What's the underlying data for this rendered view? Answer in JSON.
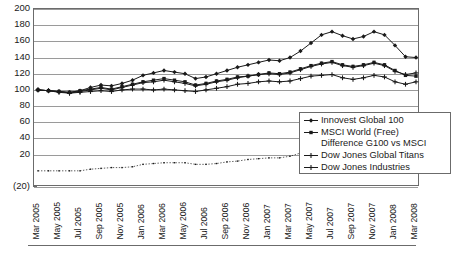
{
  "chart_data": {
    "type": "line",
    "title": "",
    "subtitle": "",
    "xlabel": "",
    "ylabel": "",
    "ylim": [
      -20,
      200
    ],
    "ytick_values": [
      200,
      180,
      160,
      140,
      120,
      100,
      80,
      60,
      40,
      20,
      0,
      -20
    ],
    "ytick_labels": [
      "200",
      "180",
      "160",
      "140",
      "120",
      "100",
      "80",
      "60",
      "40",
      "20",
      "",
      "(20)"
    ],
    "grid": "horizontal",
    "legend_position": "inside-lower-right",
    "x": [
      "Mar 2005",
      "Apr 2005",
      "May 2005",
      "Jun 2005",
      "Jul 2005",
      "Aug 2005",
      "Sep 2005",
      "Oct 2005",
      "Nov 2005",
      "Dec 2005",
      "Jan 2006",
      "Feb 2006",
      "Mar 2006",
      "Apr 2006",
      "May 2006",
      "Jun 2006",
      "Jul 2006",
      "Aug 2006",
      "Sep 2006",
      "Oct 2006",
      "Nov 2006",
      "Dec 2006",
      "Jan 2007",
      "Feb 2007",
      "Mar 2007",
      "Apr 2007",
      "May 2007",
      "Jun 2007",
      "Jul 2007",
      "Aug 2007",
      "Sep 2007",
      "Oct 2007",
      "Nov 2007",
      "Dec 2007",
      "Jan 2008",
      "Feb 2008",
      "Mar 2008"
    ],
    "xtick_labels": [
      "Mar 2005",
      "May 2005",
      "Jul 2005",
      "Sep 2005",
      "Nov 2005",
      "Jan 2006",
      "Mar 2006",
      "May 2006",
      "Jul 2006",
      "Sep 2006",
      "Nov 2006",
      "Jan 2007",
      "Mar 2007",
      "May 2007",
      "Jul 2007",
      "Sep 2007",
      "Nov 2007",
      "Jan 2008",
      "Mar 2008"
    ],
    "xtick_indices": [
      0,
      2,
      4,
      6,
      8,
      10,
      12,
      14,
      16,
      18,
      20,
      22,
      24,
      26,
      28,
      30,
      32,
      34,
      36
    ],
    "series": [
      {
        "name": "Innovest Global 100",
        "color": "#1a1a1a",
        "marker": "diamond",
        "values": [
          100,
          99,
          98,
          97,
          99,
          103,
          106,
          105,
          108,
          112,
          118,
          121,
          124,
          122,
          120,
          114,
          116,
          120,
          124,
          128,
          131,
          134,
          137,
          136,
          140,
          148,
          158,
          168,
          172,
          167,
          163,
          166,
          172,
          168,
          155,
          141,
          140
        ]
      },
      {
        "name": "MSCI World (Free)",
        "color": "#1a1a1a",
        "marker": "square",
        "values": [
          100,
          99,
          98,
          97,
          99,
          101,
          103,
          101,
          104,
          107,
          110,
          112,
          114,
          112,
          110,
          106,
          108,
          111,
          113,
          116,
          117,
          119,
          121,
          120,
          122,
          126,
          130,
          133,
          135,
          131,
          129,
          131,
          134,
          131,
          124,
          118,
          117
        ]
      },
      {
        "name": "Difference G100 vs MSCI",
        "color": "#1a1a1a",
        "marker": "none",
        "values": [
          0,
          0,
          0,
          0,
          0,
          2,
          3,
          4,
          4,
          5,
          8,
          9,
          10,
          10,
          10,
          8,
          8,
          9,
          11,
          12,
          14,
          15,
          16,
          16,
          18,
          22,
          28,
          35,
          37,
          36,
          34,
          35,
          38,
          37,
          31,
          23,
          23
        ]
      },
      {
        "name": "Dow Jones Global Titans",
        "color": "#1a1a1a",
        "marker": "cross",
        "values": [
          100,
          99,
          97,
          96,
          98,
          100,
          102,
          100,
          103,
          106,
          109,
          110,
          112,
          110,
          108,
          105,
          107,
          110,
          112,
          115,
          117,
          119,
          120,
          119,
          121,
          125,
          129,
          132,
          134,
          130,
          128,
          130,
          133,
          130,
          123,
          119,
          121
        ]
      },
      {
        "name": "Dow Jones Industries",
        "color": "#1a1a1a",
        "marker": "asterisk",
        "values": [
          100,
          99,
          98,
          96,
          97,
          98,
          99,
          98,
          100,
          101,
          101,
          100,
          101,
          100,
          99,
          98,
          100,
          102,
          104,
          107,
          108,
          110,
          111,
          110,
          111,
          114,
          117,
          118,
          119,
          115,
          113,
          115,
          118,
          116,
          110,
          107,
          110
        ]
      }
    ]
  },
  "legend": {
    "items": [
      {
        "label": "Innovest Global 100"
      },
      {
        "label": "MSCI World (Free)"
      },
      {
        "label": "Difference G100 vs MSCI"
      },
      {
        "label": "Dow Jones Global Titans"
      },
      {
        "label": "Dow Jones Industries"
      }
    ]
  }
}
